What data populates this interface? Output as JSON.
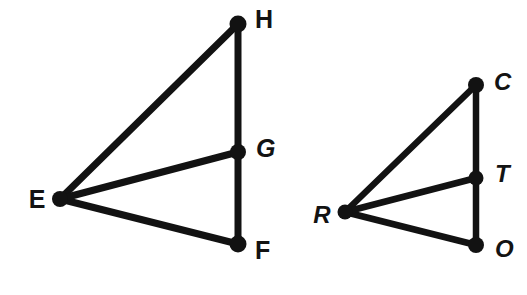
{
  "canvas": {
    "width": 527,
    "height": 295,
    "background_color": "#ffffff",
    "ink_color": "#121212"
  },
  "figures": [
    {
      "name": "triangle-efh-with-cevian-eg",
      "vertices": [
        {
          "id": "E",
          "label": "E",
          "x": 60,
          "y": 199,
          "dot_r": 8,
          "label_x": 37,
          "label_y": 201,
          "label_anchor": "middle",
          "label_size": 25,
          "label_style": "upright"
        },
        {
          "id": "H",
          "label": "H",
          "x": 238,
          "y": 24,
          "dot_r": 8.5,
          "label_x": 255,
          "label_y": 21,
          "label_anchor": "start",
          "label_size": 25,
          "label_style": "upright"
        },
        {
          "id": "G",
          "label": "G",
          "x": 238,
          "y": 152,
          "dot_r": 8,
          "label_x": 256,
          "label_y": 150,
          "label_anchor": "start",
          "label_size": 25,
          "label_style": "italic"
        },
        {
          "id": "F",
          "label": "F",
          "x": 238,
          "y": 244,
          "dot_r": 8.5,
          "label_x": 255,
          "label_y": 252,
          "label_anchor": "start",
          "label_size": 25,
          "label_style": "upright"
        }
      ],
      "edges": [
        {
          "id": "EH",
          "from": "E",
          "to": "H",
          "width": 7
        },
        {
          "id": "HF",
          "from": "H",
          "to": "F",
          "width": 7
        },
        {
          "id": "EF",
          "from": "E",
          "to": "F",
          "width": 7
        },
        {
          "id": "EG",
          "from": "E",
          "to": "G",
          "width": 7
        }
      ]
    },
    {
      "name": "triangle-rco-with-cevian-rt",
      "vertices": [
        {
          "id": "R",
          "label": "R",
          "x": 345,
          "y": 212,
          "dot_r": 7.5,
          "label_x": 322,
          "label_y": 217,
          "label_anchor": "middle",
          "label_size": 24,
          "label_style": "italic"
        },
        {
          "id": "C",
          "label": "C",
          "x": 476,
          "y": 85,
          "dot_r": 8,
          "label_x": 494,
          "label_y": 84,
          "label_anchor": "start",
          "label_size": 24,
          "label_style": "italic"
        },
        {
          "id": "T",
          "label": "T",
          "x": 476,
          "y": 178,
          "dot_r": 7.5,
          "label_x": 495,
          "label_y": 176,
          "label_anchor": "start",
          "label_size": 24,
          "label_style": "italic"
        },
        {
          "id": "O",
          "label": "O",
          "x": 476,
          "y": 245,
          "dot_r": 8,
          "label_x": 495,
          "label_y": 251,
          "label_anchor": "start",
          "label_size": 24,
          "label_style": "italic"
        }
      ],
      "edges": [
        {
          "id": "RC",
          "from": "R",
          "to": "C",
          "width": 6.5
        },
        {
          "id": "CO",
          "from": "C",
          "to": "O",
          "width": 6.5
        },
        {
          "id": "RO",
          "from": "R",
          "to": "O",
          "width": 6.5
        },
        {
          "id": "RT",
          "from": "R",
          "to": "T",
          "width": 6.5
        }
      ]
    }
  ]
}
